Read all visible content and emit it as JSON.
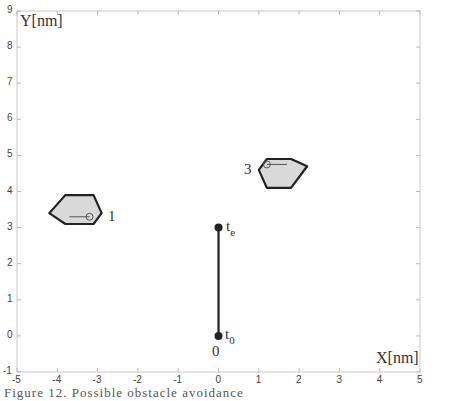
{
  "chart_data": {
    "type": "scatter",
    "title": "",
    "xlabel": "X[nm]",
    "ylabel": "Y[nm]",
    "xlim": [
      -5,
      5
    ],
    "ylim": [
      -1,
      9
    ],
    "grid": false,
    "legend": null,
    "x_ticks": [
      "-5",
      "-4",
      "-3",
      "-2",
      "-1",
      "0",
      "1",
      "2",
      "3",
      "4",
      "5"
    ],
    "y_ticks": [
      "-1",
      "0",
      "1",
      "2",
      "3",
      "4",
      "5",
      "6",
      "7",
      "8",
      "9"
    ],
    "trajectory": {
      "points": [
        {
          "x": 0,
          "y": 0,
          "label": "t0"
        },
        {
          "x": 0,
          "y": 3,
          "label": "te"
        }
      ],
      "start_label": "0",
      "start_time_label": "t",
      "start_time_sub": "0",
      "end_time_label": "t",
      "end_time_sub": "e"
    },
    "obstacles": [
      {
        "id": "1",
        "label": "1",
        "vertices": [
          [
            -4.2,
            3.4
          ],
          [
            -3.8,
            3.9
          ],
          [
            -3.1,
            3.9
          ],
          [
            -2.9,
            3.4
          ],
          [
            -3.1,
            3.1
          ],
          [
            -3.8,
            3.1
          ]
        ],
        "marker": {
          "x": -3.2,
          "y": 3.3
        },
        "heading_from": {
          "x": -3.7,
          "y": 3.3
        }
      },
      {
        "id": "3",
        "label": "3",
        "vertices": [
          [
            1.0,
            4.6
          ],
          [
            1.2,
            4.9
          ],
          [
            1.8,
            4.9
          ],
          [
            2.2,
            4.7
          ],
          [
            1.8,
            4.1
          ],
          [
            1.2,
            4.1
          ]
        ],
        "marker": {
          "x": 1.2,
          "y": 4.75
        },
        "heading_to": {
          "x": 1.7,
          "y": 4.75
        }
      }
    ],
    "colors": {
      "obstacle_fill": "#d9d9d9",
      "obstacle_edge": "#222222",
      "trajectory": "#222222",
      "axis": "#bbbbbb"
    }
  },
  "caption": "Figure 12. Possible obstacle avoidance"
}
